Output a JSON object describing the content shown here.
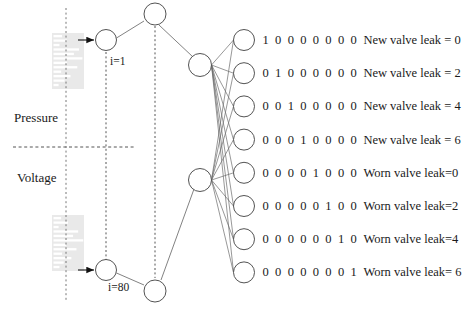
{
  "diagram": {
    "colors": {
      "node_stroke": "#4a4a4a",
      "edge": "#6b6b6b",
      "dashed": "#555555",
      "signal_box_bg": "#e9e9e9",
      "signal_bar": "#ffffff",
      "text": "#1a1a1a",
      "arrow_fill": "#111111"
    }
  },
  "inputs": {
    "signal_blocks": [
      {
        "name": "pressure-signal-block",
        "bars": [
          10,
          16,
          7,
          30,
          24,
          34,
          16,
          28,
          9,
          20,
          13,
          6
        ]
      },
      {
        "name": "voltage-signal-block",
        "bars": [
          9,
          17,
          6,
          29,
          23,
          35,
          15,
          27,
          10,
          21,
          12,
          7
        ]
      }
    ],
    "labels": {
      "pressure": "Pressure",
      "voltage": "Voltage"
    },
    "index_first": "i=1",
    "index_last": "i=80"
  },
  "outputs": {
    "rows": [
      {
        "code": "1 0 0 0 0 0 0 0",
        "desc": "New valve leak = 0"
      },
      {
        "code": "0 1 0 0 0 0 0 0",
        "desc": "New valve leak = 2"
      },
      {
        "code": "0 0 1 0 0 0 0 0",
        "desc": "New valve leak = 4"
      },
      {
        "code": "0 0 0 1 0 0 0 0",
        "desc": "New valve leak = 6"
      },
      {
        "code": "0 0 0 0 1 0 0 0",
        "desc": "Worn valve leak=0"
      },
      {
        "code": "0 0 0 0 0 1 0 0",
        "desc": "Worn valve leak=2"
      },
      {
        "code": "0 0 0 0 0 0 1 0",
        "desc": "Worn valve leak=4"
      },
      {
        "code": "0 0 0 0 0 0 0 1",
        "desc": "Worn valve leak= 6"
      }
    ]
  }
}
